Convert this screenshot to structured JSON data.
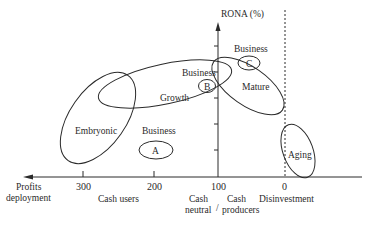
{
  "diagram": {
    "y_axis_label": "RONA (%)",
    "x_axis": {
      "left_label_line1": "Profits",
      "left_label_line2": "deployment",
      "ticks": [
        "300",
        "200",
        "100",
        "0"
      ],
      "regions": {
        "cash_users": "Cash users",
        "cash_neutral_line1": "Cash",
        "cash_neutral_line2": "neutral",
        "separator": "/",
        "cash_producers_line1": "Cash",
        "cash_producers_line2": "producers",
        "disinvestment": "Disinvestment"
      }
    },
    "stages": [
      {
        "name": "Embryonic"
      },
      {
        "name": "Growth"
      },
      {
        "name": "Mature"
      },
      {
        "name": "Aging"
      }
    ],
    "businesses": [
      {
        "label": "Business",
        "marker": "A"
      },
      {
        "label": "Business",
        "marker": "B"
      },
      {
        "label": "Business",
        "marker": "C"
      }
    ],
    "colors": {
      "line": "#2a2a2a",
      "background": "#ffffff"
    }
  }
}
